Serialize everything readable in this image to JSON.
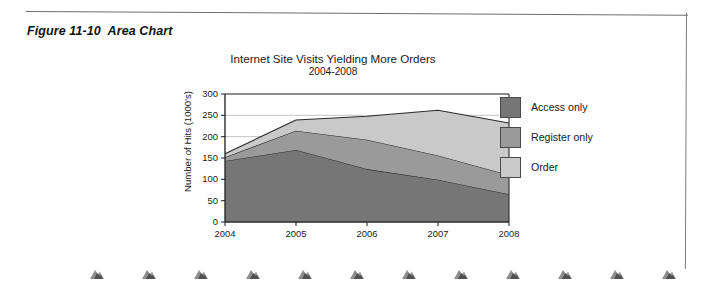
{
  "figure": {
    "caption": "Figure 11-10  Area Chart"
  },
  "chart_data": {
    "type": "area",
    "stacked": true,
    "title": "Internet Site Visits Yielding More Orders",
    "subtitle": "2004-2008",
    "xlabel": "",
    "ylabel": "Number of Hits (1000's)",
    "categories": [
      "2004",
      "2005",
      "2006",
      "2007",
      "2008"
    ],
    "x_tick_labels": [
      "2004",
      "2005",
      "2006",
      "2007",
      "2008"
    ],
    "y_tick_labels": [
      "0",
      "50",
      "100",
      "150",
      "200",
      "250",
      "300"
    ],
    "y_ticks": [
      0,
      50,
      100,
      150,
      200,
      250,
      300
    ],
    "ylim": [
      0,
      300
    ],
    "grid": "horizontal",
    "legend_position": "right",
    "series": [
      {
        "name": "Access only",
        "color": "#767676",
        "values": [
          143,
          169,
          124,
          99,
          65
        ]
      },
      {
        "name": "Register only",
        "color": "#9a9a9a",
        "values": [
          9,
          45,
          69,
          57,
          45
        ]
      },
      {
        "name": "Order",
        "color": "#c9c9c9",
        "values": [
          8,
          25,
          55,
          106,
          122
        ]
      }
    ],
    "cumulative_totals": [
      160,
      239,
      248,
      262,
      232
    ]
  },
  "legend": {
    "items": [
      {
        "label": "Access only",
        "color": "#767676"
      },
      {
        "label": "Register only",
        "color": "#9a9a9a"
      },
      {
        "label": "Order",
        "color": "#c9c9c9"
      }
    ]
  }
}
